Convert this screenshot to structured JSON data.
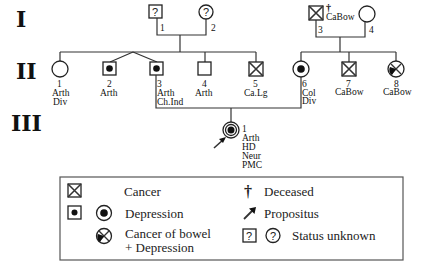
{
  "generations": {
    "I": "I",
    "II": "II",
    "III": "III"
  },
  "gen_I": [
    {
      "id": "1",
      "sex": "male",
      "status": "unknown",
      "symbol_text": "?",
      "labels": []
    },
    {
      "id": "2",
      "sex": "female",
      "status": "unknown",
      "symbol_text": "?",
      "labels": []
    },
    {
      "id": "3",
      "sex": "male",
      "status": "cancer",
      "deceased": true,
      "deceased_mark": "†",
      "labels": [
        "CaBow"
      ]
    },
    {
      "id": "4",
      "sex": "female",
      "status": "unaffected",
      "labels": []
    }
  ],
  "gen_II": [
    {
      "id": "1",
      "sex": "female",
      "status": "unaffected",
      "labels": [
        "Arth",
        "Div"
      ]
    },
    {
      "id": "2",
      "sex": "male",
      "status": "depression",
      "labels": [
        "Arth"
      ]
    },
    {
      "id": "3",
      "sex": "male",
      "status": "depression",
      "labels": [
        "Arth",
        "Ch.Ind"
      ]
    },
    {
      "id": "4",
      "sex": "male",
      "status": "unaffected",
      "labels": [
        "Arth"
      ]
    },
    {
      "id": "5",
      "sex": "male",
      "status": "cancer",
      "labels": [
        "Ca.Lg"
      ]
    },
    {
      "id": "6",
      "sex": "female",
      "status": "depression",
      "labels": [
        "Col",
        "Div"
      ]
    },
    {
      "id": "7",
      "sex": "male",
      "status": "cancer",
      "labels": [
        "CaBow"
      ]
    },
    {
      "id": "8",
      "sex": "female",
      "status": "cancer_bowel_depression",
      "labels": [
        "CaBow"
      ]
    }
  ],
  "gen_III": [
    {
      "id": "1",
      "sex": "female",
      "status": "depression",
      "propositus": true,
      "labels": [
        "Arth",
        "HD",
        "Neur",
        "PMC"
      ]
    }
  ],
  "legend": {
    "cancer": "Cancer",
    "depression": "Depression",
    "cancer_bowel_line1": "Cancer of bowel",
    "cancer_bowel_line2": "+ Depression",
    "deceased": "Deceased",
    "deceased_symbol": "†",
    "propositus": "Propositus",
    "status_unknown": "Status unknown",
    "unknown_symbol": "?"
  }
}
